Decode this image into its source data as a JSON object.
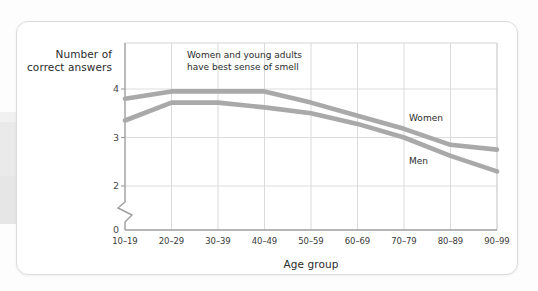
{
  "card": {
    "background": "#ffffff"
  },
  "chart_data": {
    "type": "line",
    "title": "",
    "subtitle": "",
    "xlabel": "Age group",
    "ylabel": "Number of correct answers",
    "categories": [
      "10–19",
      "20–29",
      "30–39",
      "40–49",
      "50–59",
      "60–69",
      "70–79",
      "80–89",
      "90–99"
    ],
    "ytick_labels": [
      "0",
      "2",
      "3",
      "4"
    ],
    "ytick_values": [
      0,
      2,
      3,
      4
    ],
    "ylim": [
      2,
      4.6
    ],
    "y_axis_break": true,
    "y_axis_break_note": "axis broken between 0 and 2",
    "grid": "vertical-and-horizontal",
    "legend_position": "inline-right",
    "series": [
      {
        "name": "Women",
        "color": "#a9a9a9",
        "values": [
          3.8,
          3.95,
          3.95,
          3.95,
          3.72,
          3.45,
          3.18,
          2.85,
          2.75
        ]
      },
      {
        "name": "Men",
        "color": "#a9a9a9",
        "values": [
          3.35,
          3.72,
          3.72,
          3.62,
          3.5,
          3.28,
          3.0,
          2.62,
          2.3
        ]
      }
    ],
    "annotations": [
      {
        "name": "insight-callout",
        "line1": "Women and young adults",
        "line2": "have best sense of smell"
      }
    ]
  }
}
